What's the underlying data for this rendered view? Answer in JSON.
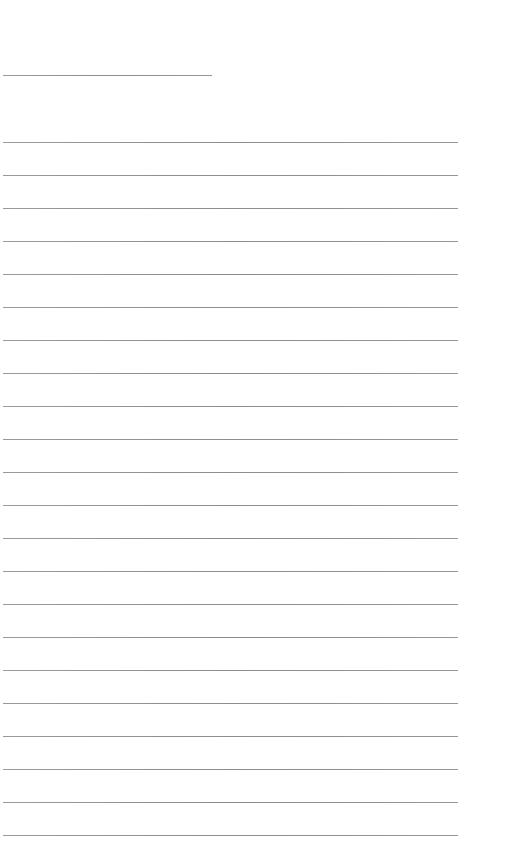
{
  "page": {
    "type": "blank-lined-sheet",
    "background_color": "#ffffff",
    "line_color": "#8f8f8f"
  },
  "header_rule": {
    "x": 3,
    "y": 75,
    "width": 209
  },
  "ruled_lines": {
    "count": 22,
    "x": 3,
    "width": 455,
    "first_y": 142,
    "spacing": 33
  }
}
